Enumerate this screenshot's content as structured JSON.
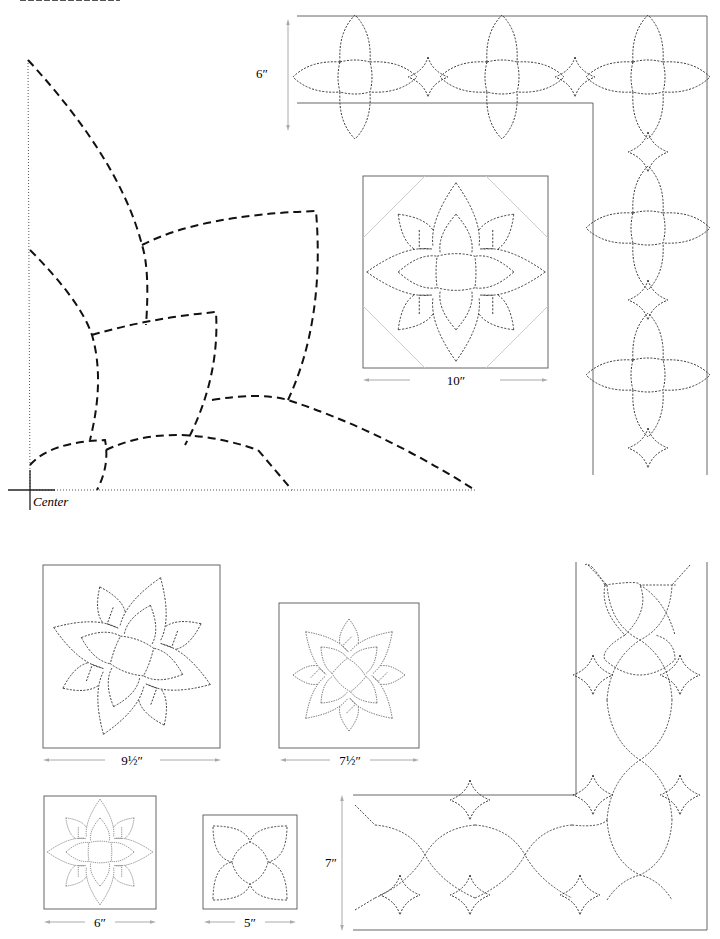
{
  "page": {
    "title_cropped": true
  },
  "large_pattern": {
    "name": "quarter-lotus-full-size-template",
    "center_label": "Center"
  },
  "border_top": {
    "name": "lotus-border-6in",
    "dimension_label": "6″"
  },
  "block_10": {
    "name": "lotus-block-10in",
    "dimension_label": "10″"
  },
  "block_9_5": {
    "name": "lotus-block-9-5in",
    "dimension_label": "9½″"
  },
  "block_7_5": {
    "name": "lotus-block-7-5in",
    "dimension_label": "7½″"
  },
  "block_6": {
    "name": "lotus-block-6in",
    "dimension_label": "6″"
  },
  "block_5": {
    "name": "lotus-block-5in",
    "dimension_label": "5″"
  },
  "border_bottom": {
    "name": "lotus-border-7in",
    "dimension_label": "7″"
  },
  "colors": {
    "line": "#222222",
    "guide": "#999999",
    "frame": "#666666",
    "diagonal": "#cccccc"
  }
}
